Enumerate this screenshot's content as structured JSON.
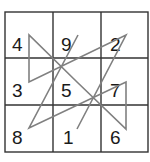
{
  "diagram": {
    "type": "magic-square-path",
    "grid": {
      "rows": 3,
      "cols": 3,
      "x0": 5,
      "y0": 12,
      "x1": 148,
      "y1": 152,
      "col_lines": [
        53,
        101
      ],
      "row_lines": [
        58,
        105
      ],
      "stroke": "#333333"
    },
    "cells": [
      [
        4,
        9,
        2
      ],
      [
        3,
        5,
        7
      ],
      [
        8,
        1,
        6
      ]
    ],
    "labels": [
      {
        "value": "4",
        "x": 12,
        "y": 43
      },
      {
        "value": "9",
        "x": 61,
        "y": 43
      },
      {
        "value": "2",
        "x": 110,
        "y": 43
      },
      {
        "value": "3",
        "x": 12,
        "y": 89
      },
      {
        "value": "5",
        "x": 61,
        "y": 89
      },
      {
        "value": "7",
        "x": 110,
        "y": 89
      },
      {
        "value": "8",
        "x": 12,
        "y": 136
      },
      {
        "value": "1",
        "x": 63,
        "y": 136
      },
      {
        "value": "6",
        "x": 110,
        "y": 136
      }
    ],
    "path": {
      "order": [
        1,
        2,
        3,
        4,
        5,
        6,
        7,
        8,
        9
      ],
      "points": "77,129 126,35 29,82 29,35 77,82 126,129 126,82 29,128 78,35",
      "stroke": "#808080"
    }
  }
}
